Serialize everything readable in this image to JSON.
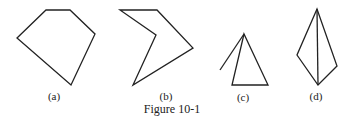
{
  "figure": {
    "caption": "Figure 10-1",
    "stroke_color": "#222222",
    "panels": [
      {
        "label": "(a)",
        "shape": "convex pentagon",
        "points": [
          [
            46,
            10
          ],
          [
            70,
            10
          ],
          [
            95,
            34
          ],
          [
            71,
            85
          ],
          [
            17,
            38
          ]
        ],
        "closed": true
      },
      {
        "label": "(b)",
        "shape": "concave pentagon",
        "points": [
          [
            120,
            10
          ],
          [
            157,
            10
          ],
          [
            193,
            48
          ],
          [
            133,
            85
          ],
          [
            156,
            35
          ]
        ],
        "closed": true
      },
      {
        "label": "(c)",
        "shape": "triangle with extra segment",
        "points": [
          [
            244,
            34
          ],
          [
            232,
            85
          ],
          [
            268,
            85
          ]
        ],
        "closed": true,
        "extra_segment": [
          [
            244,
            34
          ],
          [
            220,
            70
          ]
        ]
      },
      {
        "label": "(d)",
        "shape": "quadrilateral with diagonal",
        "points": [
          [
            317,
            9
          ],
          [
            297,
            55
          ],
          [
            318,
            85
          ],
          [
            337,
            66
          ]
        ],
        "closed": true,
        "extra_segment": [
          [
            317,
            9
          ],
          [
            318,
            85
          ]
        ]
      }
    ]
  }
}
